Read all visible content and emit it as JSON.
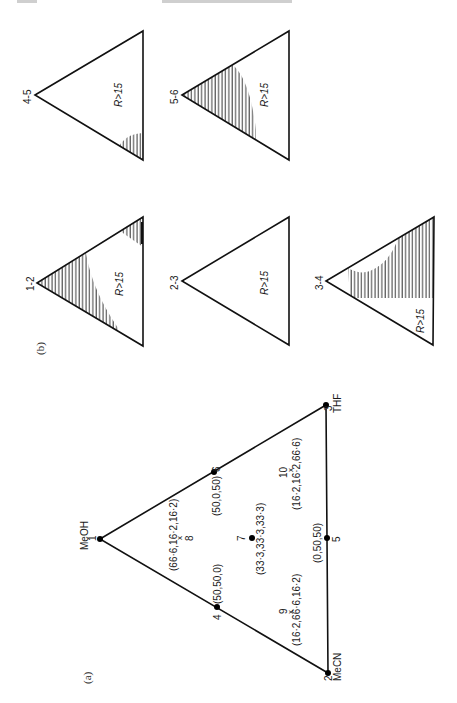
{
  "figure": {
    "orientation": "rotated 90deg clockwise on page",
    "panel_a": {
      "label": "(a)",
      "vertices": [
        {
          "id": "1",
          "name": "MeOH",
          "composition": "(100,0,0)"
        },
        {
          "id": "2",
          "name": "MeCN",
          "composition": "(0,100,0)"
        },
        {
          "id": "3",
          "name": "THF",
          "composition": "(0,0,100)"
        }
      ],
      "points": [
        {
          "id": "4",
          "label": "(50,50,0)",
          "marker": "dot"
        },
        {
          "id": "5",
          "label": "(0,50,50)",
          "marker": "dot"
        },
        {
          "id": "6",
          "label": "(50,0,50)",
          "marker": "dot"
        },
        {
          "id": "7",
          "label": "(33·3,33·3,33·3)",
          "marker": "dot"
        },
        {
          "id": "8",
          "label": "(66·6,16·2,16·2)",
          "marker": "cross"
        },
        {
          "id": "9",
          "label": "(16·2,66·6,16·2)",
          "marker": "cross"
        },
        {
          "id": "10",
          "label": "(16·2,16·2,66·6)",
          "marker": "cross"
        }
      ]
    },
    "panel_b": {
      "label": "(b)",
      "region_label": "R>15",
      "subplots": [
        {
          "pair": "1-2",
          "shaded": "regions near MeOH vertex and THF vertex"
        },
        {
          "pair": "2-3",
          "shaded": "none"
        },
        {
          "pair": "3-4",
          "shaded": "large region along THF side"
        },
        {
          "pair": "4-5",
          "shaded": "small region near THF vertex"
        },
        {
          "pair": "5-6",
          "shaded": "large region along MeOH-MeCN side"
        }
      ]
    }
  }
}
